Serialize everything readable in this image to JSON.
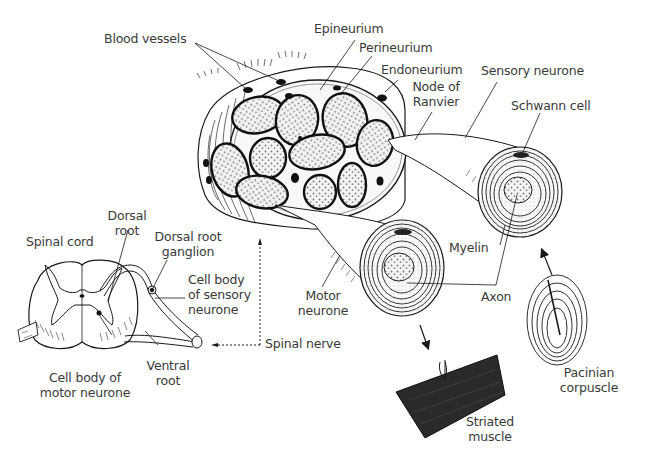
{
  "diagram": {
    "labels": {
      "blood_vessels": "Blood vessels",
      "epineurium": "Epineurium",
      "perineurium": "Perineurium",
      "endoneurium": "Endoneurium",
      "node_of_ranvier_1": "Node of",
      "node_of_ranvier_2": "Ranvier",
      "sensory_neurone": "Sensory neurone",
      "schwann_cell": "Schwann cell",
      "spinal_cord": "Spinal cord",
      "dorsal_root_1": "Dorsal",
      "dorsal_root_2": "root",
      "dorsal_root_ganglion_1": "Dorsal root",
      "dorsal_root_ganglion_2": "ganglion",
      "cell_body_sensory_1": "Cell body",
      "cell_body_sensory_2": "of sensory",
      "cell_body_sensory_3": "neurone",
      "ventral_root_1": "Ventral",
      "ventral_root_2": "root",
      "cell_body_motor_1": "Cell body of",
      "cell_body_motor_2": "motor neurone",
      "spinal_nerve": "Spinal nerve",
      "motor_neurone_1": "Motor",
      "motor_neurone_2": "neurone",
      "myelin": "Myelin",
      "axon": "Axon",
      "striated_muscle_1": "Striated",
      "striated_muscle_2": "muscle",
      "pacinian_corpuscle_1": "Pacinian",
      "pacinian_corpuscle_2": "corpuscle"
    },
    "colors": {
      "ink": "#1a1a1a",
      "label_text": "#3a3a3a",
      "background": "#ffffff",
      "muscle_fill": "#2a2a2a",
      "stipple": "#888888"
    }
  }
}
